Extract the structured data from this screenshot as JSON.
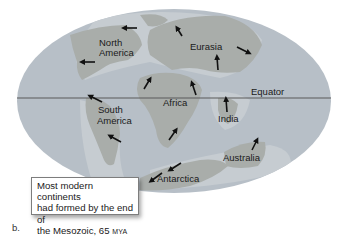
{
  "figure": {
    "panel_label": "b.",
    "caption": {
      "line1": "Most modern continents",
      "line2": "had formed by the end of",
      "line3_prefix": "the Mesozoic, 65 ",
      "line3_unit": "MYA"
    },
    "equator_label": "Equator",
    "continents": [
      {
        "name": "North America",
        "line1": "North",
        "line2": "America"
      },
      {
        "name": "Eurasia",
        "line1": "Eurasia"
      },
      {
        "name": "Africa",
        "line1": "Africa"
      },
      {
        "name": "South America",
        "line1": "South",
        "line2": "America"
      },
      {
        "name": "India",
        "line1": "India"
      },
      {
        "name": "Australia",
        "line1": "Australia"
      },
      {
        "name": "Antarctica",
        "line1": "Antarctica"
      }
    ],
    "colors": {
      "ocean": "#b4bcc4",
      "ocean_shallow": "#c9ced3",
      "land": "#a9aca9",
      "equator_line": "#5a5a5a",
      "arrow": "#111111"
    }
  }
}
